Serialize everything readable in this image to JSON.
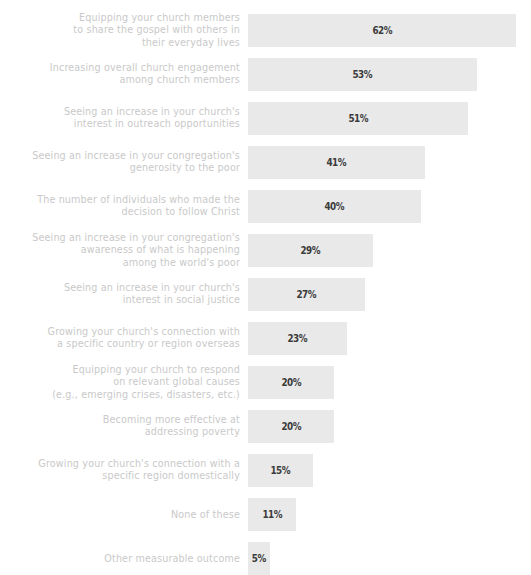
{
  "chart_data": {
    "type": "bar",
    "orientation": "horizontal",
    "title": "",
    "subtitle": "",
    "xlabel": "",
    "ylabel": "",
    "grid": false,
    "legend": "none",
    "xlim": [
      0,
      62
    ],
    "value_suffix": "%",
    "categories": [
      "Equipping your church members\nto share the gospel with others in\ntheir everyday lives",
      "Increasing overall church engagement\namong church members",
      "Seeing an increase in your church's\ninterest in outreach opportunities",
      "Seeing an increase in your congregation's\ngenerosity to the poor",
      "The number of individuals who made the\ndecision to follow Christ",
      "Seeing an increase in your congregation's\nawareness of what is happening\namong the world's poor",
      "Seeing an increase in your church's\ninterest in social justice",
      "Growing your church's connection with\na specific country or region overseas",
      "Equipping your church to respond\non relevant global causes\n(e.g., emerging crises, disasters, etc.)",
      "Becoming more effective at\naddressing poverty",
      "Growing your church's connection with a\nspecific region domestically",
      "None of these",
      "Other measurable outcome"
    ],
    "values": [
      62,
      53,
      51,
      41,
      40,
      29,
      27,
      23,
      20,
      20,
      15,
      11,
      5
    ],
    "value_labels": [
      "62%",
      "53%",
      "51%",
      "41%",
      "40%",
      "29%",
      "27%",
      "23%",
      "20%",
      "20%",
      "15%",
      "11%",
      "5%"
    ]
  },
  "style": {
    "bar_color": "#e9e9e9",
    "label_color": "#c9c9c9",
    "value_color": "#3b3b3b",
    "background": "#ffffff"
  }
}
